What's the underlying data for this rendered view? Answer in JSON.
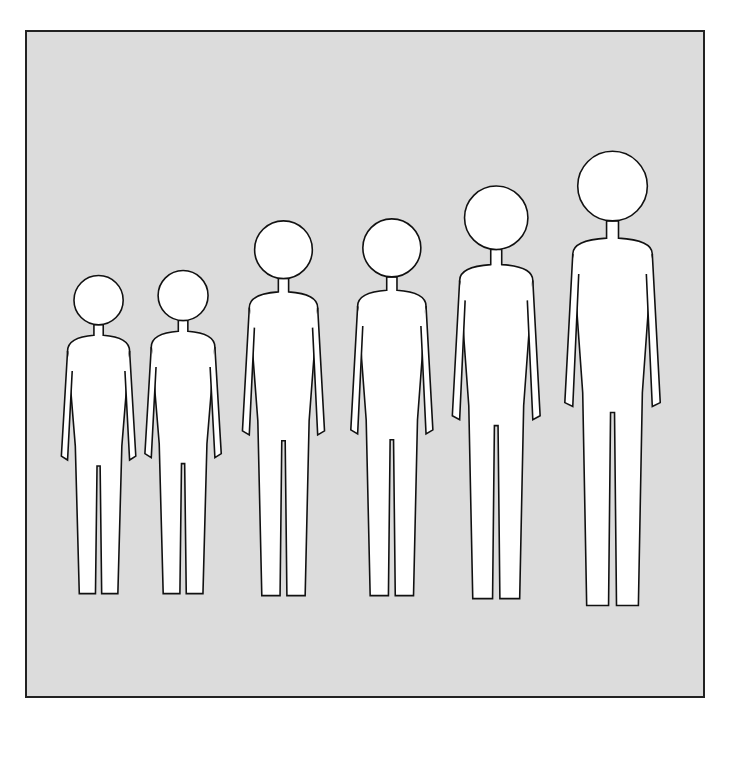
{
  "illustration": {
    "subject": "Six standing figures arranged left to right in order of increasing age and height, rendered as simplified outline silhouettes",
    "panel_background": "#dcdcdc",
    "line_color": "#111111",
    "figures": [
      {
        "label": "figure-1",
        "cx": 97,
        "top": 275,
        "bottom": 605,
        "scale": 0.78
      },
      {
        "label": "figure-2",
        "cx": 182,
        "top": 270,
        "bottom": 605,
        "scale": 0.8
      },
      {
        "label": "figure-3",
        "cx": 283,
        "top": 220,
        "bottom": 607,
        "scale": 0.86
      },
      {
        "label": "figure-4",
        "cx": 392,
        "top": 218,
        "bottom": 607,
        "scale": 0.86
      },
      {
        "label": "figure-5",
        "cx": 497,
        "top": 185,
        "bottom": 610,
        "scale": 0.92
      },
      {
        "label": "figure-6",
        "cx": 614,
        "top": 150,
        "bottom": 617,
        "scale": 1.0
      }
    ]
  },
  "caption": {
    "visible_text": ""
  }
}
